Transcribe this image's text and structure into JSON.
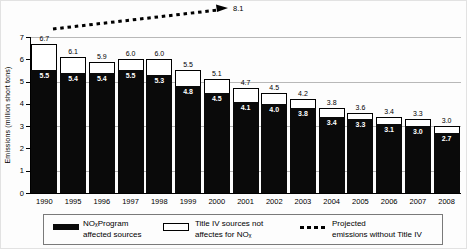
{
  "chart_data": {
    "type": "bar",
    "stacked": true,
    "title": "",
    "xlabel": "",
    "ylabel": "Emissions (million short tons)",
    "ylim": [
      0,
      7
    ],
    "yticks": [
      0,
      1,
      2,
      3,
      4,
      5,
      6,
      7
    ],
    "gridlines_at": [
      1,
      3,
      5,
      7
    ],
    "legend_position": "bottom",
    "categories": [
      "1990",
      "1995",
      "1996",
      "1997",
      "1998",
      "1999",
      "2000",
      "2001",
      "2002",
      "2003",
      "2004",
      "2005",
      "2006",
      "2007",
      "2008"
    ],
    "series": [
      {
        "name": "NOₓProgram affected sources",
        "color": "#0a0a0a",
        "values": [
          5.5,
          5.4,
          5.4,
          5.5,
          5.3,
          4.8,
          4.5,
          4.1,
          4.0,
          3.8,
          3.4,
          3.3,
          3.1,
          3.0,
          2.7
        ]
      },
      {
        "name": "Title IV sources not affectes for NOₓ",
        "color": "#ffffff",
        "values": [
          1.2,
          0.7,
          0.5,
          0.5,
          0.7,
          0.7,
          0.6,
          0.6,
          0.5,
          0.4,
          0.4,
          0.3,
          0.3,
          0.3,
          0.3
        ]
      }
    ],
    "totals": [
      6.7,
      6.1,
      5.9,
      6.0,
      6.0,
      5.5,
      5.1,
      4.7,
      4.5,
      4.2,
      3.8,
      3.6,
      3.4,
      3.3,
      3.0
    ],
    "projected": {
      "name": "Projected emissions without Title IV",
      "end_value": 8.1,
      "end_label": "8.1",
      "style": "dotted-arrow"
    }
  },
  "axes": {
    "y_title": "Emissions (million short tons)"
  },
  "annotations": {
    "projected_end_label": "8.1"
  },
  "legend": {
    "items": [
      {
        "swatch": "black-bar",
        "label_line1": "NOₓProgram",
        "label_line2": "affected sources"
      },
      {
        "swatch": "white-bar",
        "label_line1": "Title IV sources not",
        "label_line2": "affectes for NOₓ"
      },
      {
        "swatch": "dotted-line",
        "label_line1": "Projected",
        "label_line2": "emissions without Title IV"
      }
    ]
  },
  "colors": {
    "bar_black": "#0a0a0a",
    "bar_white": "#ffffff",
    "gridline": "#b8b8b8",
    "axis": "#000000"
  }
}
